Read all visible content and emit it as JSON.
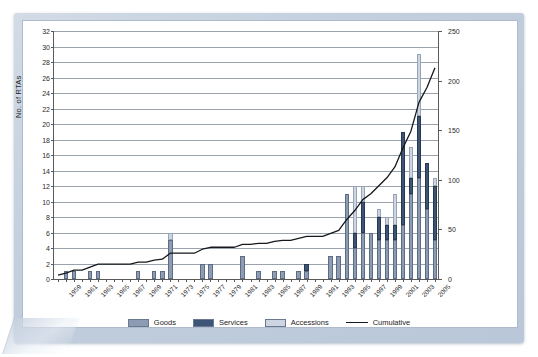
{
  "chart_data": {
    "type": "bar",
    "title": "",
    "xlabel": "",
    "ylabel": "No. of RTAs",
    "y2label": "",
    "ylim": [
      0,
      32
    ],
    "y2lim": [
      0,
      250
    ],
    "ytick_step": 2,
    "y2tick_step": 50,
    "grid": true,
    "legend_position": "bottom",
    "stacked": true,
    "yticks": [
      0,
      2,
      4,
      6,
      8,
      10,
      12,
      14,
      16,
      18,
      20,
      22,
      24,
      26,
      28,
      30,
      32
    ],
    "y2ticks": [
      0,
      50,
      100,
      150,
      200,
      250
    ],
    "categories": [
      1959,
      1960,
      1961,
      1962,
      1963,
      1964,
      1965,
      1966,
      1967,
      1968,
      1969,
      1970,
      1971,
      1972,
      1973,
      1974,
      1975,
      1976,
      1977,
      1978,
      1979,
      1980,
      1981,
      1982,
      1983,
      1984,
      1985,
      1986,
      1987,
      1988,
      1989,
      1990,
      1991,
      1992,
      1993,
      1994,
      1995,
      1996,
      1997,
      1998,
      1999,
      2000,
      2001,
      2002,
      2003,
      2004,
      2005,
      2006
    ],
    "xtick_labels": [
      "1959",
      "1961",
      "1963",
      "1965",
      "1967",
      "1969",
      "1971",
      "1973",
      "1975",
      "1977",
      "1979",
      "1981",
      "1983",
      "1985",
      "1987",
      "1989",
      "1991",
      "1993",
      "1995",
      "1997",
      "1999",
      "2001",
      "2003",
      "2005"
    ],
    "series": [
      {
        "name": "Goods",
        "color": "#8d9cb2",
        "values": [
          0,
          1,
          1,
          0,
          1,
          1,
          0,
          0,
          0,
          0,
          1,
          0,
          1,
          1,
          5,
          0,
          0,
          0,
          2,
          2,
          0,
          0,
          0,
          3,
          0,
          1,
          0,
          1,
          1,
          0,
          1,
          1,
          0,
          0,
          3,
          3,
          11,
          4,
          6,
          6,
          5,
          5,
          5,
          7,
          11,
          13,
          9,
          5
        ]
      },
      {
        "name": "Services",
        "color": "#3c5475",
        "values": [
          0,
          0,
          0,
          0,
          0,
          0,
          0,
          0,
          0,
          0,
          0,
          0,
          0,
          0,
          0,
          0,
          0,
          0,
          0,
          0,
          0,
          0,
          0,
          0,
          0,
          0,
          0,
          0,
          0,
          0,
          0,
          1,
          0,
          0,
          0,
          0,
          0,
          2,
          4,
          0,
          3,
          2,
          2,
          12,
          2,
          8,
          6,
          7
        ]
      },
      {
        "name": "Accessions",
        "color": "#ccd5e1",
        "values": [
          0,
          0,
          0,
          0,
          0,
          0,
          0,
          0,
          0,
          0,
          0,
          0,
          0,
          0,
          1,
          0,
          0,
          0,
          0,
          0,
          0,
          0,
          0,
          0,
          0,
          0,
          0,
          0,
          0,
          0,
          0,
          0,
          0,
          0,
          0,
          0,
          0,
          6,
          2,
          0,
          1,
          1,
          4,
          0,
          4,
          8,
          0,
          1
        ]
      }
    ],
    "cumulative": {
      "name": "Cumulative",
      "color": "#15181c",
      "axis": "right",
      "values": [
        4,
        6,
        9,
        9,
        12,
        15,
        15,
        15,
        15,
        15,
        17,
        17,
        19,
        20,
        26,
        26,
        26,
        26,
        30,
        32,
        32,
        32,
        32,
        35,
        35,
        36,
        36,
        38,
        39,
        39,
        41,
        43,
        43,
        43,
        46,
        49,
        60,
        69,
        80,
        86,
        94,
        102,
        113,
        132,
        149,
        178,
        193,
        213
      ]
    },
    "legend": [
      {
        "label": "Goods",
        "type": "swatch",
        "color": "#8d9cb2"
      },
      {
        "label": "Services",
        "type": "swatch",
        "color": "#3c5475"
      },
      {
        "label": "Accessions",
        "type": "swatch",
        "color": "#ccd5e1"
      },
      {
        "label": "Cumulative",
        "type": "line",
        "color": "#15181c"
      }
    ]
  }
}
